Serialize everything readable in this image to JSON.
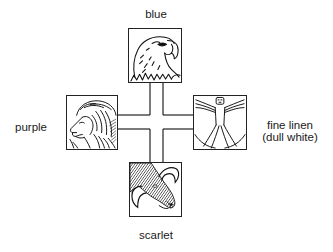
{
  "diagram": {
    "layout": "cross with four emblem panels",
    "center": {
      "shape": "cross-connector"
    },
    "panels": [
      {
        "position": "top",
        "emblem": "eagle-head",
        "color_label": "blue"
      },
      {
        "position": "left",
        "emblem": "lion-head",
        "color_label": "purple"
      },
      {
        "position": "right",
        "emblem": "human-figure",
        "color_label": "fine linen",
        "color_label_line2": "(dull white)"
      },
      {
        "position": "bottom",
        "emblem": "ox-head",
        "color_label": "scarlet"
      }
    ]
  },
  "labels": {
    "top": "blue",
    "left": "purple",
    "right_line1": "fine linen",
    "right_line2": "(dull white)",
    "bottom": "scarlet"
  },
  "colors": {
    "line": "#222222",
    "background": "#ffffff",
    "text": "#1a1a1a"
  }
}
